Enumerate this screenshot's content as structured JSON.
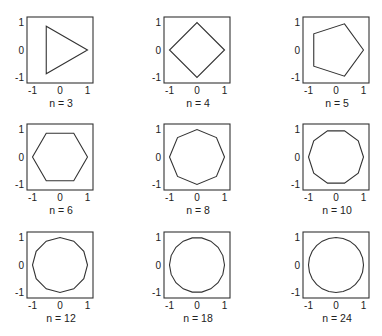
{
  "chart_data": {
    "type": "line",
    "title": "",
    "grid": false,
    "layout": "3x3 small multiples",
    "line_color": "#333333",
    "panels": [
      {
        "n": 3,
        "label": "n = 3"
      },
      {
        "n": 4,
        "label": "n = 4"
      },
      {
        "n": 5,
        "label": "n = 5"
      },
      {
        "n": 6,
        "label": "n = 6"
      },
      {
        "n": 8,
        "label": "n = 8"
      },
      {
        "n": 10,
        "label": "n = 10"
      },
      {
        "n": 12,
        "label": "n = 12"
      },
      {
        "n": 18,
        "label": "n = 18"
      },
      {
        "n": 24,
        "label": "n = 24"
      }
    ],
    "xlim": [
      -1.2,
      1.2
    ],
    "ylim": [
      -1.2,
      1.2
    ],
    "xticks": [
      -1,
      0,
      1
    ],
    "yticks": [
      -1,
      0,
      1
    ],
    "xtick_labels": [
      "-1",
      "0",
      "1"
    ],
    "ytick_labels": [
      "1",
      "0",
      "-1"
    ],
    "xlabel": "",
    "ylabel": ""
  }
}
